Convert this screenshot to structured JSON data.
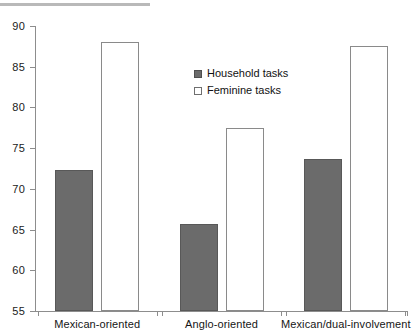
{
  "chart_data": {
    "type": "bar",
    "title": "",
    "subtitle": "",
    "xlabel": "",
    "ylabel": "",
    "categories": [
      "Mexican-oriented",
      "Anglo-oriented",
      "Mexican/dual-involvement"
    ],
    "series": [
      {
        "name": "Household tasks",
        "style": "filled",
        "color": "#6b6b6b",
        "values": [
          72.3,
          65.7,
          73.7
        ]
      },
      {
        "name": "Feminine tasks",
        "style": "outline",
        "color": "#ffffff",
        "values": [
          88.0,
          77.5,
          87.5
        ]
      }
    ],
    "ylim": [
      55,
      90
    ],
    "ytick_values": [
      55,
      60,
      65,
      70,
      75,
      80,
      85,
      90
    ],
    "ytick_labels": [
      "55",
      "60",
      "65",
      "70",
      "75",
      "80",
      "85",
      "90"
    ],
    "grid": false,
    "legend_position": "upper-center"
  },
  "legend": {
    "items": [
      {
        "label": "Household tasks",
        "style": "filled"
      },
      {
        "label": "Feminine tasks",
        "style": "outline"
      }
    ]
  }
}
